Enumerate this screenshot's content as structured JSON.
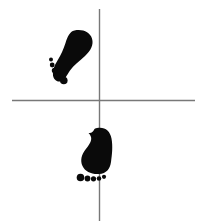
{
  "figure": {
    "background_color": "#ffffff",
    "width": 199,
    "height": 223
  },
  "axes": {
    "line_color": "#787878",
    "line_width": 1.4,
    "vertical": {
      "label": "vertical-axis-line",
      "x": 99.5,
      "y1": 9,
      "y2": 221
    },
    "horizontal": {
      "label": "horizontal-axis-line",
      "y": 100.5,
      "x1": 12,
      "x2": 195
    },
    "origin": {
      "x": 99.5,
      "y": 100.5
    }
  },
  "footprints": [
    {
      "name": "upper-left-footprint",
      "side": "left",
      "quadrant": "upper-left",
      "fill_color": "#0a0a0a",
      "rotation_degrees": 38,
      "sole_path": "M 74.5 30.5 C 82.5 28.8 90.0 32.0 92.0 38.5 C 94.0 45.0 90.5 51.0 85.0 56.0 C 79.5 61.0 73.5 65.5 70.0 70.5 C 66.8 75.2 65.0 79.5 61.5 81.0 C 57.5 82.7 53.8 80.0 53.0 75.5 C 52.2 71.0 54.0 66.0 57.5 60.5 C 61.0 55.0 63.5 49.0 65.5 43.0 C 67.4 37.2 69.5 31.6 74.5 30.5 Z",
      "toes": [
        {
          "name": "toe-1",
          "cx": 51.0,
          "cy": 59.5,
          "rx": 2.0,
          "ry": 2.0
        },
        {
          "name": "toe-2",
          "cx": 52.2,
          "cy": 65.0,
          "rx": 2.4,
          "ry": 2.4
        },
        {
          "name": "toe-3",
          "cx": 54.5,
          "cy": 70.5,
          "rx": 2.7,
          "ry": 2.7
        },
        {
          "name": "toe-4",
          "cx": 57.8,
          "cy": 75.8,
          "rx": 3.0,
          "ry": 3.0
        },
        {
          "name": "toe-5",
          "cx": 63.8,
          "cy": 80.5,
          "rx": 3.8,
          "ry": 3.8
        }
      ]
    },
    {
      "name": "lower-footprint",
      "side": "right",
      "quadrant": "lower-center",
      "fill_color": "#0a0a0a",
      "rotation_degrees": 4,
      "sole_path": "M 97.0 128.0 C 104.5 126.5 110.0 130.5 111.5 138.5 C 113.0 146.5 112.0 155.0 111.0 162.0 C 110.0 169.0 106.5 173.5 99.0 174.0 C 91.5 174.5 85.0 171.5 82.5 166.0 C 80.0 160.5 81.5 154.5 85.5 149.5 C 89.5 144.5 92.0 140.5 91.0 137.0 C 90.2 134.2 88.5 133.0 88.5 133.0 C 92.0 133.5 93.5 131.0 94.0 129.8 C 94.6 128.6 95.6 128.3 97.0 128.0 Z",
      "toes": [
        {
          "name": "toe-1",
          "cx": 80.5,
          "cy": 177.5,
          "rx": 3.8,
          "ry": 3.8
        },
        {
          "name": "toe-2",
          "cx": 87.5,
          "cy": 178.5,
          "rx": 2.9,
          "ry": 2.9
        },
        {
          "name": "toe-3",
          "cx": 93.5,
          "cy": 178.8,
          "rx": 2.6,
          "ry": 2.6
        },
        {
          "name": "toe-4",
          "cx": 99.0,
          "cy": 178.5,
          "rx": 2.3,
          "ry": 2.3
        },
        {
          "name": "toe-5",
          "cx": 104.0,
          "cy": 176.8,
          "rx": 2.1,
          "ry": 2.1
        }
      ]
    }
  ]
}
